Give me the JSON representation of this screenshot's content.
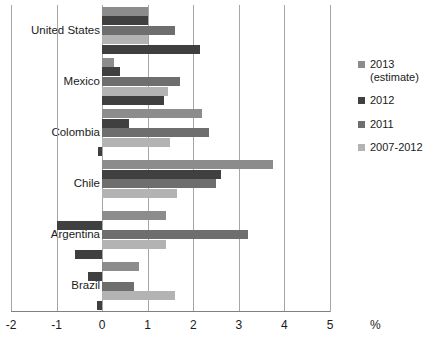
{
  "chart_data": {
    "type": "bar",
    "orientation": "horizontal",
    "title": "",
    "xlabel": "%",
    "ylabel": "",
    "xlim": [
      -2,
      5
    ],
    "xticks": [
      "-2",
      "-1",
      "0",
      "1",
      "2",
      "3",
      "4",
      "5"
    ],
    "xtick_values": [
      -2,
      -1,
      0,
      1,
      2,
      3,
      4,
      5
    ],
    "grid": true,
    "legend_position": "right",
    "categories": [
      "United States",
      "Mexico",
      "Colombia",
      "Chile",
      "Argentina",
      "Brazil"
    ],
    "series": [
      {
        "name": "2013 (estimate)",
        "color": "#8c8c8c",
        "values": [
          1.0,
          0.25,
          2.2,
          3.75,
          1.4,
          0.8
        ]
      },
      {
        "name": "2012",
        "color": "#404040",
        "values": [
          1.0,
          0.4,
          0.6,
          2.6,
          -1.0,
          -0.3
        ]
      },
      {
        "name": "2011",
        "color": "#6e6e6e",
        "values": [
          1.6,
          1.7,
          2.35,
          2.5,
          3.2,
          0.7
        ]
      },
      {
        "name": "2007-2012",
        "color": "#b3b3b3",
        "values": [
          1.0,
          1.45,
          1.5,
          1.65,
          1.4,
          1.6
        ]
      },
      {
        "name": "trailing",
        "color": "#3f3f3f",
        "values": [
          2.15,
          1.35,
          -0.1,
          0.0,
          -0.6,
          -0.12
        ]
      }
    ],
    "legend_entries": [
      {
        "label": "2013\n(estimate)",
        "color": "#8c8c8c"
      },
      {
        "label": "2012",
        "color": "#404040"
      },
      {
        "label": "2011",
        "color": "#6e6e6e"
      },
      {
        "label": "2007-2012",
        "color": "#b3b3b3"
      }
    ]
  }
}
